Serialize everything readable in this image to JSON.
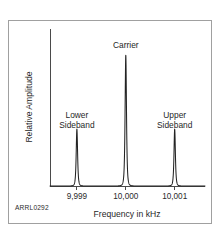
{
  "figure": {
    "credit": "ARRL0292",
    "background_color": "#ffffff",
    "frame_color": "#a0a0a0",
    "trace_color": "#232323",
    "axis_color": "#4a4a4a"
  },
  "chart_data": {
    "type": "line",
    "title": "",
    "subtitle": "",
    "xlabel": "Frequency in kHz",
    "ylabel": "Relative Amplitude",
    "grid": false,
    "legend_position": "none",
    "x_tick_labels": [
      "9,999",
      "10,000",
      "10,001"
    ],
    "x_tick_values": [
      9999,
      10000,
      10001
    ],
    "xlim": [
      9998.45,
      10001.62
    ],
    "ylim": [
      0,
      1.06
    ],
    "y_tick_labels": [],
    "annotations": [
      {
        "text": "Lower Sideband",
        "line1": "Lower",
        "line2": "Sideband",
        "x": 9999,
        "y": 0.46
      },
      {
        "text": "Carrier",
        "line1": "Carrier",
        "line2": "",
        "x": 10000,
        "y": 0.93
      },
      {
        "text": "Upper Sideband",
        "line1": "Upper",
        "line2": "Sideband",
        "x": 10001,
        "y": 0.46
      }
    ],
    "series": [
      {
        "name": "Spectrum",
        "peaks": [
          {
            "label": "Lower Sideband",
            "x": 9999,
            "amplitude": 0.385,
            "width": 0.018
          },
          {
            "label": "Carrier",
            "x": 10000,
            "amplitude": 0.885,
            "width": 0.018
          },
          {
            "label": "Upper Sideband",
            "x": 10001,
            "amplitude": 0.385,
            "width": 0.018
          }
        ],
        "baseline": 0.0
      }
    ]
  }
}
